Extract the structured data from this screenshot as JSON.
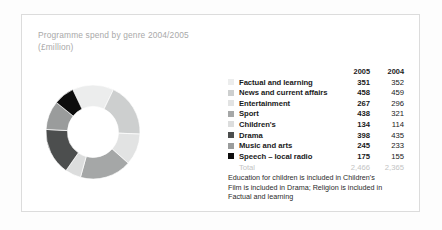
{
  "panel": {
    "title": "Programme spend by genre 2004/2005\n(£million)",
    "footnote": "Education for children is included in Children's\nFilm is included in Drama; Religion is included in\nFactual and learning"
  },
  "table": {
    "header_spacer": "",
    "col_2005": "2005",
    "col_2004": "2004",
    "total_label": "Total",
    "total_2005": "2,466",
    "total_2004": "2,365"
  },
  "chart_data": {
    "type": "pie",
    "title": "Programme spend by genre 2004/2005 (£million)",
    "subtitle": "(£million)",
    "unit": "£million",
    "legend_position": "right",
    "grid": false,
    "series_years": [
      "2005",
      "2004"
    ],
    "categories": [
      "Factual and learning",
      "News and current affairs",
      "Entertainment",
      "Sport",
      "Children's",
      "Drama",
      "Music and arts",
      "Speech – local radio"
    ],
    "values": [
      351,
      458,
      267,
      438,
      134,
      398,
      245,
      175
    ],
    "values_2004": [
      352,
      459,
      296,
      321,
      114,
      435,
      233,
      155
    ],
    "colors": [
      "#eceded",
      "#cdcfcf",
      "#e2e3e3",
      "#a5a7a7",
      "#dcdddd",
      "#4c4e4e",
      "#9a9c9c",
      "#0d0d0d"
    ],
    "total_2005": 2466,
    "total_2004": 2365,
    "rows": [
      {
        "label": "Factual and learning",
        "v2005": "351",
        "v2004": "352",
        "color": "#eceded"
      },
      {
        "label": "News and current affairs",
        "v2005": "458",
        "v2004": "459",
        "color": "#cdcfcf"
      },
      {
        "label": "Entertainment",
        "v2005": "267",
        "v2004": "296",
        "color": "#e2e3e3"
      },
      {
        "label": "Sport",
        "v2005": "438",
        "v2004": "321",
        "color": "#a5a7a7"
      },
      {
        "label": "Children's",
        "v2005": "134",
        "v2004": "114",
        "color": "#dcdddd"
      },
      {
        "label": "Drama",
        "v2005": "398",
        "v2004": "435",
        "color": "#4c4e4e"
      },
      {
        "label": "Music and arts",
        "v2005": "245",
        "v2004": "233",
        "color": "#9a9c9c"
      },
      {
        "label": "Speech – local radio",
        "v2005": "175",
        "v2004": "155",
        "color": "#0d0d0d"
      }
    ]
  }
}
